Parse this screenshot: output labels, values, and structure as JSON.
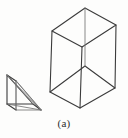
{
  "figure": {
    "caption": "(a)",
    "background_color": "#fdfdfc",
    "line_color": "#3b3b3b",
    "hidden_line_color": "#757575",
    "objects": [
      {
        "name": "triangular-prism",
        "label": "wedge",
        "description": "small right triangular prism drawn in oblique projection at lower left",
        "vertices": {
          "front_top": [
            7,
            75
          ],
          "front_bottom_left": [
            7,
            104
          ],
          "front_bottom_right": [
            33,
            104
          ],
          "back_top": [
            16,
            81
          ],
          "back_bottom_left": [
            16,
            110
          ],
          "back_bottom_right": [
            41,
            110
          ]
        }
      },
      {
        "name": "rectangular-box",
        "label": "box",
        "description": "tall open rectangular box drawn in isometric projection at right",
        "vertices": {
          "top_back": [
            85,
            8
          ],
          "top_left": [
            52,
            31
          ],
          "top_right": [
            116,
            25
          ],
          "top_front": [
            82,
            47
          ],
          "bottom_back": [
            85,
            66
          ],
          "bottom_left": [
            50,
            92
          ],
          "bottom_right": [
            115,
            88
          ],
          "bottom_front": [
            80,
            108
          ]
        }
      }
    ]
  }
}
